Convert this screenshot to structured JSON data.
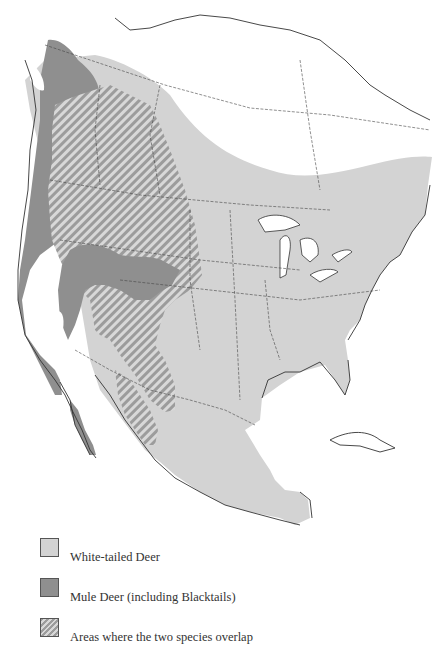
{
  "map": {
    "subject": "Range of White-tailed Deer and Mule Deer in North America",
    "colors": {
      "white_tailed": "#d3d3d3",
      "mule": "#8f8f8f",
      "overlap_base": "#d6d6d6",
      "overlap_stripe": "#9a9a9a",
      "outline": "#333333",
      "background": "#ffffff"
    }
  },
  "legend": {
    "items": [
      {
        "key": "white_tailed",
        "label": "White-tailed Deer",
        "swatch_color": "#d3d3d3",
        "pattern": "solid"
      },
      {
        "key": "mule",
        "label": "Mule Deer (including Blacktails)",
        "swatch_color": "#8f8f8f",
        "pattern": "solid"
      },
      {
        "key": "overlap",
        "label": "Areas where the two species overlap",
        "swatch_color": "#a0a0a0",
        "pattern": "diagonal-hatch"
      }
    ]
  }
}
